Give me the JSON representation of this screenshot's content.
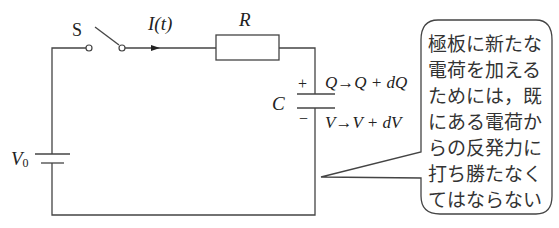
{
  "diagram": {
    "type": "RC charging circuit",
    "labels": {
      "switch": "S",
      "current": "I(t)",
      "resistor": "R",
      "capacitor": "C",
      "battery": "V",
      "battery_sub": "0",
      "plus": "+",
      "minus": "−",
      "charge_change": "Q→Q + dQ",
      "voltage_change": "V→V + dV"
    },
    "callout": {
      "lines": [
        "極板に新たな",
        "電荷を加える",
        "ためには，既",
        "にある電荷か",
        "らの反発力に",
        "打ち勝たなく",
        "てはならない"
      ]
    },
    "colors": {
      "line": "#444444",
      "text": "#222222",
      "background": "#ffffff"
    }
  }
}
